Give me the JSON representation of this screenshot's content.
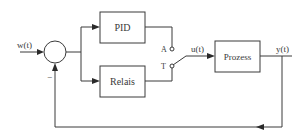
{
  "diagram": {
    "type": "block-diagram",
    "signals": {
      "reference": "w(t)",
      "control": "u(t)",
      "output": "y(t)",
      "feedback_sign": "−"
    },
    "blocks": {
      "pid": "PID",
      "relais": "Relais",
      "prozess": "Prozess"
    },
    "switch": {
      "contact_a": "A",
      "contact_t": "T",
      "selected": "T"
    },
    "colors": {
      "line": "#3a3a3a",
      "background": "#ffffff"
    }
  }
}
